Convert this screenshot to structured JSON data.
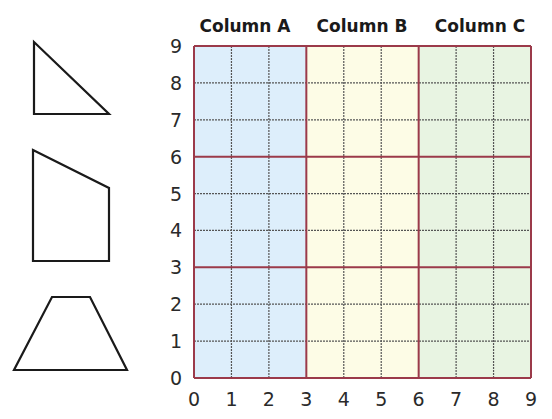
{
  "columns": [
    {
      "label": "Column A",
      "fill": "#ddeefb",
      "x_from": 0,
      "x_to": 3
    },
    {
      "label": "Column B",
      "fill": "#fdfce6",
      "x_from": 3,
      "x_to": 6
    },
    {
      "label": "Column C",
      "fill": "#e8f4e2",
      "x_from": 6,
      "x_to": 9
    }
  ],
  "grid": {
    "x_ticks": [
      "0",
      "1",
      "2",
      "3",
      "4",
      "5",
      "6",
      "7",
      "8",
      "9"
    ],
    "y_ticks": [
      "0",
      "1",
      "2",
      "3",
      "4",
      "5",
      "6",
      "7",
      "8",
      "9"
    ],
    "major_line_color": "#9b3a4a",
    "minor_line_color": "#555555",
    "major_every": 3
  },
  "shapes": [
    {
      "name": "right-triangle",
      "points": "34,42 34,114 109,114"
    },
    {
      "name": "quadrilateral",
      "points": "33,150 109,188 109,261 33,261"
    },
    {
      "name": "trapezoid",
      "points": "52,297 90,297 127,370 14,370"
    }
  ]
}
